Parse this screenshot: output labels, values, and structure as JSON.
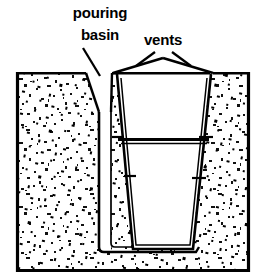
{
  "figure": {
    "type": "technical-cross-section",
    "background_color": "#ffffff",
    "line_color": "#000000",
    "sand_fill_color": "#ffffff",
    "speckle_color": "#000000"
  },
  "labels": {
    "pouring_basin": {
      "line1": "pouring",
      "line2": "basin",
      "x": 100,
      "y1": 18,
      "y2": 40
    },
    "vents": {
      "text": "vents",
      "x": 163,
      "y": 45
    }
  },
  "geometry": {
    "mold_box": {
      "left": 16,
      "top": 72,
      "right": 250,
      "bottom": 272
    },
    "pouring_basin_notch": {
      "left": 86,
      "apex_x": 99,
      "right": 112,
      "depth_y": 112
    },
    "sprue": {
      "left_x": 99,
      "right_x": 111,
      "bottom_y": 252
    },
    "cavity": {
      "top_left_x": 117,
      "top_right_x": 210,
      "bottom_left_x": 134,
      "bottom_right_x": 192,
      "top_y": 74,
      "bottom_y": 250
    },
    "parting_line_y": 140,
    "vent_left": {
      "base_x": 113,
      "apex_x": 144,
      "apex_y": 60
    },
    "vent_right": {
      "base_x": 213,
      "apex_x": 183,
      "apex_y": 60
    }
  },
  "annotations": {
    "tick_marks": 4,
    "leader_lines": 3
  }
}
